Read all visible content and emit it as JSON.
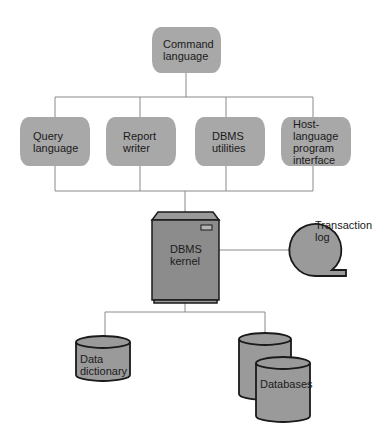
{
  "diagram": {
    "nodes": {
      "command": {
        "label": "Command\nlanguage"
      },
      "query": {
        "label": "Query\nlanguage"
      },
      "report": {
        "label": "Report\nwriter"
      },
      "utilities": {
        "label": "DBMS\nutilities"
      },
      "host": {
        "label": "Host-\nlanguage\nprogram\ninterface"
      },
      "kernel": {
        "label": "DBMS\nkernel"
      },
      "log": {
        "label": "Transaction\nlog"
      },
      "dictionary": {
        "label": "Data\ndictionary"
      },
      "databases": {
        "label": "Databases"
      }
    },
    "edges": [
      [
        "command",
        "query"
      ],
      [
        "command",
        "report"
      ],
      [
        "command",
        "utilities"
      ],
      [
        "command",
        "host"
      ],
      [
        "query",
        "kernel"
      ],
      [
        "report",
        "kernel"
      ],
      [
        "utilities",
        "kernel"
      ],
      [
        "host",
        "kernel"
      ],
      [
        "kernel",
        "log"
      ],
      [
        "kernel",
        "dictionary"
      ],
      [
        "kernel",
        "databases"
      ]
    ],
    "colors": {
      "fill": "#a8a8a8",
      "server_fill": "#8c8c8c",
      "line": "#8a8a8a",
      "outline": "#1a1a1a"
    }
  }
}
